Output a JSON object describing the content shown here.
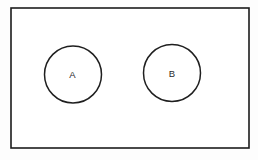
{
  "diagram": {
    "type": "venn-diagram",
    "background_color": "#fdfdfd",
    "stroke_color": "#1f1f1f",
    "fill_color": "#ffffff",
    "universal_set": {
      "name": "universal-set-rectangle",
      "label": "",
      "x": 11,
      "y": 8,
      "width": 238,
      "height": 140,
      "stroke_width": 1.6
    },
    "sets": [
      {
        "name": "set-a",
        "label": "A",
        "cx": 73,
        "cy": 74.5,
        "r": 28.5,
        "label_x": 72.5,
        "label_y": 75.5
      },
      {
        "name": "set-b",
        "label": "B",
        "cx": 172,
        "cy": 73,
        "r": 28.5,
        "label_x": 172,
        "label_y": 74
      }
    ]
  }
}
